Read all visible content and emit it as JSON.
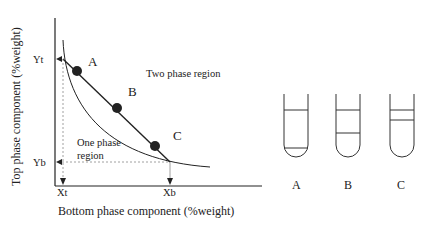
{
  "diagram": {
    "axes": {
      "xlabel": "Bottom phase component (%weight)",
      "ylabel": "Top phase component (%weight)",
      "x_ticks": [
        "Xt",
        "Xb"
      ],
      "y_ticks": [
        "Yt",
        "Yb"
      ]
    },
    "regions": {
      "two_phase": "Two phase region",
      "one_phase_line1": "One phase",
      "one_phase_line2": "region"
    },
    "points": [
      {
        "label": "A"
      },
      {
        "label": "B"
      },
      {
        "label": "C"
      }
    ],
    "tubes": [
      {
        "label": "A"
      },
      {
        "label": "B"
      },
      {
        "label": "C"
      }
    ],
    "colors": {
      "line": "#222222",
      "guide": "#888888",
      "dot": "#222222"
    }
  }
}
